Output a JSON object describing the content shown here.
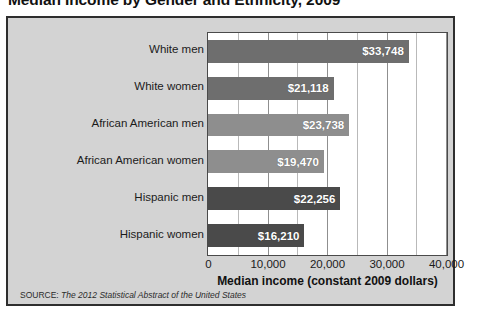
{
  "title": "Median Income by Gender and Ethnicity, 2009",
  "source": {
    "label": "SOURCE:",
    "text": "The 2012 Statistical Abstract of the United States"
  },
  "colors": {
    "panel_background": "#d3d3d3",
    "panel_border": "#2e2e2e",
    "plot_background": "#ffffff",
    "plot_border": "#4a4a4a",
    "gridline": "#b9b9b9",
    "gridline_major": "#8f8f8f",
    "value_label_text": "#ffffff",
    "text": "#1b1b1b"
  },
  "chart_data": {
    "type": "bar",
    "orientation": "horizontal",
    "title": "Median Income by Gender and Ethnicity, 2009",
    "xlabel": "Median income (constant 2009 dollars)",
    "ylabel": "",
    "xlim": [
      0,
      40000
    ],
    "xticks": [
      0,
      10000,
      20000,
      30000,
      40000
    ],
    "xtick_labels": [
      "0",
      "10,000",
      "20,000",
      "30,000",
      "40,000"
    ],
    "minor_tick_step": 5000,
    "grid": true,
    "legend": false,
    "categories": [
      "White men",
      "White women",
      "African American men",
      "African American women",
      "Hispanic men",
      "Hispanic women"
    ],
    "values": [
      33748,
      21118,
      23738,
      19470,
      22256,
      16210
    ],
    "value_labels": [
      "$33,748",
      "$21,118",
      "$23,738",
      "$19,470",
      "$22,256",
      "$16,210"
    ],
    "bar_colors": [
      "#6e6e6e",
      "#6e6e6e",
      "#8e8e8e",
      "#8e8e8e",
      "#4a4a4a",
      "#4a4a4a"
    ]
  }
}
